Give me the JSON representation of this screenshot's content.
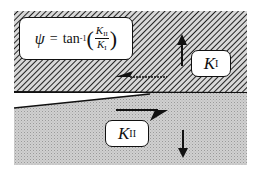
{
  "diagram": {
    "formula": {
      "lhs": "ψ",
      "equals": "=",
      "function": "tan",
      "exponent": "-1",
      "numerator_symbol": "K",
      "numerator_sub": "II",
      "denominator_symbol": "K",
      "denominator_sub": "I"
    },
    "labels": {
      "mode_one": {
        "symbol": "K",
        "sub": "I"
      },
      "mode_two": {
        "symbol": "K",
        "sub": "II"
      }
    },
    "arrows": [
      {
        "name": "opening-up",
        "direction": "up",
        "region": "upper"
      },
      {
        "name": "shear-left",
        "direction": "left",
        "region": "upper"
      },
      {
        "name": "shear-right",
        "direction": "right",
        "region": "lower"
      },
      {
        "name": "opening-down",
        "direction": "down",
        "region": "lower"
      }
    ],
    "colors": {
      "hatch_line": "#222222",
      "upper_bg": "#bdbdbd",
      "lower_bg": "#c8c8c8",
      "ink": "#111111"
    }
  }
}
